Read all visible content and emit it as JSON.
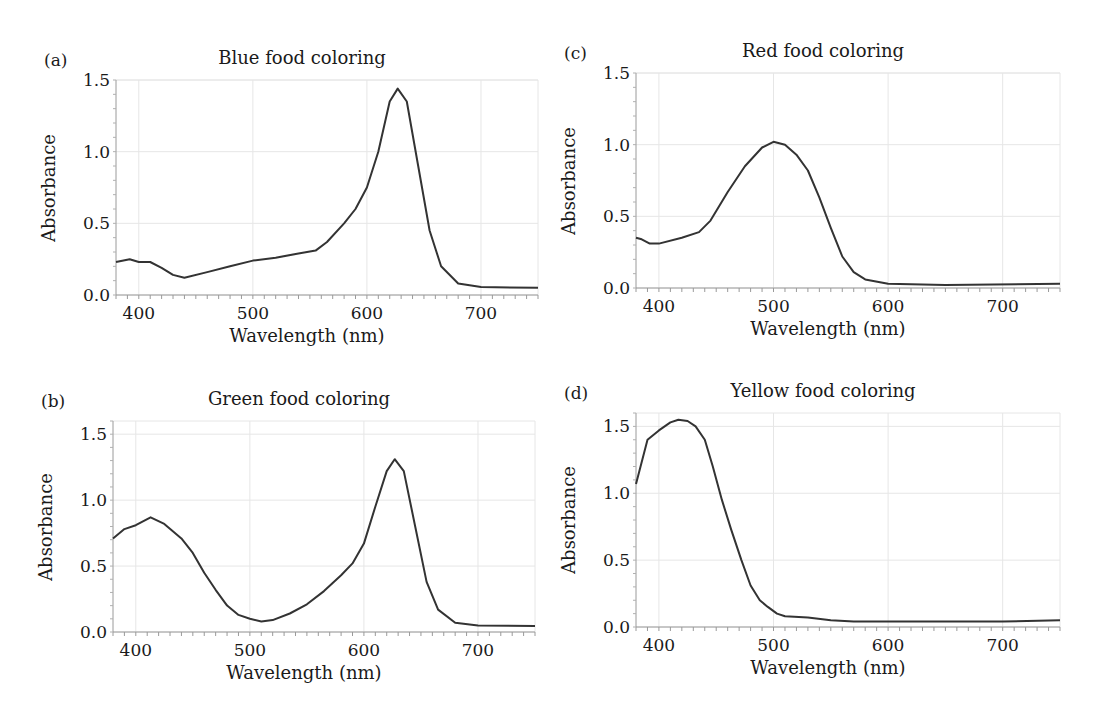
{
  "figure": {
    "panels": [
      {
        "id": "a",
        "letter": "(a)",
        "title": "Blue food coloring",
        "xlabel": "Wavelength (nm)",
        "ylabel": "Absorbance"
      },
      {
        "id": "b",
        "letter": "(b)",
        "title": "Green food coloring",
        "xlabel": "Wavelength (nm)",
        "ylabel": "Absorbance"
      },
      {
        "id": "c",
        "letter": "(c)",
        "title": "Red food coloring",
        "xlabel": "Wavelength (nm)",
        "ylabel": "Absorbance"
      },
      {
        "id": "d",
        "letter": "(d)",
        "title": "Yellow food coloring",
        "xlabel": "Wavelength (nm)",
        "ylabel": "Absorbance"
      }
    ],
    "xticks": [
      "400",
      "500",
      "600",
      "700"
    ],
    "yticks": [
      "0.0",
      "0.5",
      "1.0",
      "1.5"
    ],
    "line_color": "#333333",
    "grid_color": "#e6e6e6"
  },
  "chart_data": [
    {
      "type": "line",
      "panel": "(a)",
      "title": "Blue food coloring",
      "xlabel": "Wavelength (nm)",
      "ylabel": "Absorbance",
      "xlim": [
        380,
        750
      ],
      "ylim": [
        0,
        1.5
      ],
      "xticks": [
        400,
        500,
        600,
        700
      ],
      "yticks": [
        0.0,
        0.5,
        1.0,
        1.5
      ],
      "grid": true,
      "series": [
        {
          "name": "Blue food coloring",
          "x": [
            380,
            392,
            400,
            410,
            420,
            430,
            440,
            460,
            480,
            500,
            520,
            540,
            555,
            565,
            580,
            590,
            600,
            610,
            620,
            627,
            635,
            645,
            655,
            665,
            680,
            700,
            750
          ],
          "y": [
            0.23,
            0.25,
            0.23,
            0.23,
            0.19,
            0.14,
            0.12,
            0.16,
            0.2,
            0.24,
            0.26,
            0.29,
            0.31,
            0.37,
            0.5,
            0.6,
            0.75,
            1.0,
            1.35,
            1.44,
            1.35,
            0.9,
            0.45,
            0.2,
            0.08,
            0.055,
            0.05
          ]
        }
      ]
    },
    {
      "type": "line",
      "panel": "(b)",
      "title": "Green food coloring",
      "xlabel": "Wavelength (nm)",
      "ylabel": "Absorbance",
      "xlim": [
        380,
        750
      ],
      "ylim": [
        0,
        1.6
      ],
      "xticks": [
        400,
        500,
        600,
        700
      ],
      "yticks": [
        0.0,
        0.5,
        1.0,
        1.5
      ],
      "grid": true,
      "series": [
        {
          "name": "Green food coloring",
          "x": [
            380,
            390,
            400,
            413,
            425,
            440,
            450,
            460,
            470,
            480,
            490,
            500,
            510,
            520,
            535,
            550,
            565,
            580,
            590,
            600,
            610,
            620,
            627,
            635,
            645,
            655,
            665,
            680,
            700,
            750
          ],
          "y": [
            0.71,
            0.78,
            0.81,
            0.87,
            0.82,
            0.71,
            0.6,
            0.45,
            0.32,
            0.2,
            0.13,
            0.1,
            0.08,
            0.09,
            0.14,
            0.21,
            0.31,
            0.43,
            0.52,
            0.67,
            0.95,
            1.22,
            1.31,
            1.22,
            0.8,
            0.38,
            0.17,
            0.07,
            0.05,
            0.045
          ]
        }
      ]
    },
    {
      "type": "line",
      "panel": "(c)",
      "title": "Red food coloring",
      "xlabel": "Wavelength (nm)",
      "ylabel": "Absorbance",
      "xlim": [
        380,
        750
      ],
      "ylim": [
        0,
        1.5
      ],
      "xticks": [
        400,
        500,
        600,
        700
      ],
      "yticks": [
        0.0,
        0.5,
        1.0,
        1.5
      ],
      "grid": true,
      "series": [
        {
          "name": "Red food coloring",
          "x": [
            380,
            385,
            392,
            400,
            420,
            435,
            445,
            460,
            475,
            490,
            500,
            510,
            520,
            530,
            540,
            550,
            560,
            570,
            580,
            600,
            650,
            750
          ],
          "y": [
            0.35,
            0.34,
            0.31,
            0.31,
            0.35,
            0.39,
            0.47,
            0.67,
            0.85,
            0.98,
            1.02,
            1.0,
            0.93,
            0.82,
            0.63,
            0.42,
            0.22,
            0.11,
            0.06,
            0.03,
            0.02,
            0.03
          ]
        }
      ]
    },
    {
      "type": "line",
      "panel": "(d)",
      "title": "Yellow food coloring",
      "xlabel": "Wavelength (nm)",
      "ylabel": "Absorbance",
      "xlim": [
        380,
        750
      ],
      "ylim": [
        0,
        1.6
      ],
      "xticks": [
        400,
        500,
        600,
        700
      ],
      "yticks": [
        0.0,
        0.5,
        1.0,
        1.5
      ],
      "grid": true,
      "series": [
        {
          "name": "Yellow food coloring",
          "x": [
            380,
            390,
            400,
            410,
            417,
            425,
            432,
            440,
            447,
            455,
            463,
            472,
            480,
            488,
            495,
            503,
            510,
            530,
            550,
            570,
            600,
            650,
            700,
            750
          ],
          "y": [
            1.07,
            1.4,
            1.47,
            1.53,
            1.55,
            1.54,
            1.5,
            1.4,
            1.2,
            0.95,
            0.73,
            0.5,
            0.31,
            0.2,
            0.15,
            0.1,
            0.08,
            0.07,
            0.05,
            0.04,
            0.04,
            0.04,
            0.04,
            0.05
          ]
        }
      ]
    }
  ]
}
